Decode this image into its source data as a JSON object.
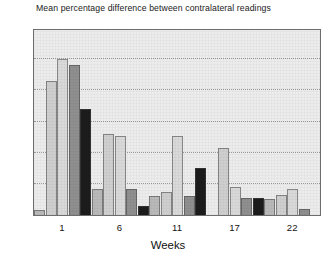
{
  "chart_data": {
    "type": "bar",
    "title": "Mean percentage difference between contralateral readings",
    "xlabel": "Weeks",
    "ylabel": "",
    "ylim": [
      0,
      60
    ],
    "ytick_values": [
      0,
      10,
      20,
      30,
      40,
      50,
      60
    ],
    "ytick_labels": [
      "0",
      "10",
      "20",
      "30",
      "40",
      "50",
      "60"
    ],
    "xtick_labels": [
      "1",
      "6",
      "11",
      "17",
      "22"
    ],
    "grid": true,
    "legend": "none",
    "groups": [
      {
        "label": "1",
        "values": [
          1.5,
          43,
          50,
          48,
          34
        ]
      },
      {
        "label": "6",
        "values": [
          8.5,
          26,
          25.5,
          8.5,
          3
        ]
      },
      {
        "label": "11",
        "values": [
          6,
          7.5,
          25.5,
          6,
          15
        ]
      },
      {
        "label": "17",
        "values": [
          0,
          21.5,
          9,
          5.5,
          5.5
        ]
      },
      {
        "label": "22",
        "values": [
          5,
          6.5,
          8.5,
          2,
          0
        ]
      }
    ],
    "bar_shades": [
      "#b9b9b9",
      "#cfcfcf",
      "#d9d9d9",
      "#8f8f8f",
      "#1c1c1c"
    ],
    "series": [
      {
        "name": "bar-1",
        "values": [
          1.5,
          8.5,
          6,
          0,
          5
        ]
      },
      {
        "name": "bar-2",
        "values": [
          43,
          26,
          7.5,
          21.5,
          6.5
        ]
      },
      {
        "name": "bar-3",
        "values": [
          50,
          25.5,
          25.5,
          9,
          8.5
        ]
      },
      {
        "name": "bar-4",
        "values": [
          48,
          8.5,
          6,
          5.5,
          2
        ]
      },
      {
        "name": "bar-5",
        "values": [
          34,
          3,
          15,
          5.5,
          0
        ]
      }
    ],
    "colors": {
      "plot_background": "#ececed",
      "axis": "#6d6d6d",
      "gridline": "#9a9a9a",
      "text": "#151515"
    }
  }
}
